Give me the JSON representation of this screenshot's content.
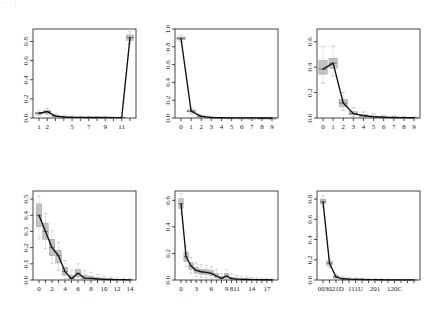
{
  "figure": {
    "artifact_text": "' ' ' |",
    "axis_label_frequency": "Fequency"
  },
  "chart_data": [
    {
      "type": "line",
      "title": "Geodesic distances",
      "xlabel": "Geodesic distances",
      "ylabel": "Fequency",
      "x_ticks": [
        "1",
        "2",
        "5",
        "7",
        "9",
        "11"
      ],
      "x_tick_positions": [
        1,
        2,
        5,
        7,
        9,
        11
      ],
      "categories": [
        "1",
        "2",
        "3",
        "4",
        "5",
        "6",
        "7",
        "8",
        "9",
        "10",
        "11",
        "Inf"
      ],
      "values": [
        0.05,
        0.066,
        0.02,
        0.01,
        0.007,
        0.006,
        0.005,
        0.005,
        0.005,
        0.004,
        0.004,
        0.84
      ],
      "box_lower": [
        0.04,
        0.05,
        0.013,
        0.006,
        0.004,
        0.003,
        0.003,
        0.003,
        0.003,
        0.002,
        0.002,
        0.81
      ],
      "box_upper": [
        0.06,
        0.08,
        0.028,
        0.015,
        0.011,
        0.009,
        0.008,
        0.008,
        0.007,
        0.006,
        0.006,
        0.868
      ],
      "whisker_lower": [
        0.028,
        0.036,
        0.006,
        0.001,
        0.001,
        0.001,
        0.0,
        0.0,
        0.0,
        0.0,
        0.0,
        0.775
      ],
      "whisker_upper": [
        0.075,
        0.098,
        0.042,
        0.026,
        0.02,
        0.017,
        0.015,
        0.014,
        0.013,
        0.012,
        0.011,
        0.9
      ],
      "ylim": [
        0.0,
        0.93
      ],
      "y_ticks": [
        "0.0",
        "0.2",
        "0.4",
        "0.6",
        "0.8"
      ],
      "y_tick_values": [
        0.0,
        0.2,
        0.4,
        0.6,
        0.8
      ],
      "grid": false,
      "legend": "none"
    },
    {
      "type": "line",
      "title": "Dyad-wise shared partners",
      "xlabel": "Dyad-wise shared partners",
      "ylabel": "Fequency",
      "x_ticks": [
        "0",
        "1",
        "2",
        "3",
        "4",
        "5",
        "6",
        "7",
        "8",
        "9"
      ],
      "categories": [
        "0",
        "1",
        "2",
        "3",
        "4",
        "5",
        "6",
        "7",
        "8",
        "9"
      ],
      "values": [
        0.895,
        0.078,
        0.018,
        0.006,
        0.003,
        0.002,
        0.001,
        0.001,
        0.0,
        0.0
      ],
      "box_lower": [
        0.88,
        0.068,
        0.013,
        0.004,
        0.002,
        0.001,
        0.0,
        0.0,
        0.0,
        0.0
      ],
      "box_upper": [
        0.91,
        0.09,
        0.024,
        0.009,
        0.005,
        0.003,
        0.002,
        0.001,
        0.001,
        0.0
      ],
      "whisker_lower": [
        0.86,
        0.052,
        0.006,
        0.001,
        0.0,
        0.0,
        0.0,
        0.0,
        0.0,
        0.0
      ],
      "whisker_upper": [
        0.932,
        0.108,
        0.034,
        0.016,
        0.009,
        0.006,
        0.004,
        0.003,
        0.002,
        0.001
      ],
      "ylim": [
        0.0,
        1.0
      ],
      "y_ticks": [
        "0.0",
        "0.2",
        "0.4",
        "0.6",
        "0.8",
        "1.0"
      ],
      "y_tick_values": [
        0.0,
        0.2,
        0.4,
        0.6,
        0.8,
        1.0
      ],
      "grid": false,
      "legend": "none"
    },
    {
      "type": "line",
      "title": "Edge-wise shared partners",
      "xlabel": "Edge-wise shared partners",
      "ylabel": "Fequency",
      "x_ticks": [
        "0",
        "1",
        "2",
        "3",
        "4",
        "5",
        "6",
        "7",
        "8",
        "9"
      ],
      "categories": [
        "0",
        "1",
        "2",
        "3",
        "4",
        "5",
        "6",
        "7",
        "8",
        "9"
      ],
      "values": [
        0.385,
        0.432,
        0.118,
        0.035,
        0.018,
        0.01,
        0.006,
        0.004,
        0.003,
        0.002
      ],
      "box_lower": [
        0.345,
        0.392,
        0.092,
        0.024,
        0.011,
        0.005,
        0.002,
        0.001,
        0.001,
        0.0
      ],
      "box_upper": [
        0.452,
        0.47,
        0.146,
        0.05,
        0.027,
        0.016,
        0.01,
        0.007,
        0.005,
        0.004
      ],
      "whisker_lower": [
        0.275,
        0.33,
        0.06,
        0.01,
        0.003,
        0.0,
        0.0,
        0.0,
        0.0,
        0.0
      ],
      "whisker_upper": [
        0.56,
        0.565,
        0.2,
        0.082,
        0.048,
        0.032,
        0.022,
        0.016,
        0.012,
        0.009
      ],
      "ylim": [
        0.0,
        0.7
      ],
      "y_ticks": [
        "0.0",
        "0.2",
        "0.4",
        "0.6"
      ],
      "y_tick_values": [
        0.0,
        0.2,
        0.4,
        0.6
      ],
      "grid": false,
      "legend": "none"
    },
    {
      "type": "line",
      "title": "Indegree",
      "xlabel": "Indegree",
      "ylabel": "Fequency",
      "x_ticks": [
        "0",
        "2",
        "4",
        "6",
        "8",
        "10",
        "12",
        "14"
      ],
      "x_tick_positions": [
        0,
        2,
        4,
        6,
        8,
        10,
        12,
        14
      ],
      "categories": [
        "0",
        "1",
        "2",
        "3",
        "4",
        "5",
        "6",
        "7",
        "8",
        "9",
        "10",
        "11",
        "12",
        "13",
        "14"
      ],
      "values": [
        0.4,
        0.3,
        0.2,
        0.15,
        0.052,
        0.008,
        0.042,
        0.012,
        0.01,
        0.006,
        0.004,
        0.003,
        0.002,
        0.002,
        0.001
      ],
      "box_lower": [
        0.33,
        0.252,
        0.15,
        0.105,
        0.03,
        0.0,
        0.02,
        0.004,
        0.003,
        0.001,
        0.0,
        0.0,
        0.0,
        0.0,
        0.0
      ],
      "box_upper": [
        0.47,
        0.352,
        0.252,
        0.185,
        0.078,
        0.028,
        0.066,
        0.028,
        0.024,
        0.015,
        0.01,
        0.007,
        0.005,
        0.004,
        0.003
      ],
      "whisker_lower": [
        0.255,
        0.195,
        0.1,
        0.062,
        0.008,
        0.0,
        0.0,
        0.0,
        0.0,
        0.0,
        0.0,
        0.0,
        0.0,
        0.0,
        0.0
      ],
      "whisker_upper": [
        0.52,
        0.41,
        0.305,
        0.232,
        0.12,
        0.06,
        0.1,
        0.058,
        0.048,
        0.034,
        0.024,
        0.018,
        0.013,
        0.01,
        0.008
      ],
      "ylim": [
        0.0,
        0.55
      ],
      "y_ticks": [
        "0.0",
        "0.1",
        "0.2",
        "0.3",
        "0.4",
        "0.5"
      ],
      "y_tick_values": [
        0.0,
        0.1,
        0.2,
        0.3,
        0.4,
        0.5
      ],
      "grid": false,
      "legend": "none"
    },
    {
      "type": "line",
      "title": "Outdegree",
      "xlabel": "Outdegree",
      "ylabel": "Fequency",
      "x_ticks": [
        "0",
        "3",
        "6",
        "9",
        "8",
        "11",
        "14",
        "17"
      ],
      "x_tick_positions": [
        0,
        3,
        6,
        9,
        10,
        11,
        14,
        17
      ],
      "categories": [
        "0",
        "1",
        "2",
        "3",
        "4",
        "5",
        "6",
        "7",
        "8",
        "9",
        "10",
        "11",
        "12",
        "13",
        "14",
        "15",
        "16",
        "17",
        "18"
      ],
      "values": [
        0.575,
        0.175,
        0.105,
        0.072,
        0.062,
        0.058,
        0.05,
        0.03,
        0.012,
        0.03,
        0.01,
        0.006,
        0.005,
        0.004,
        0.003,
        0.003,
        0.002,
        0.002,
        0.001
      ],
      "box_lower": [
        0.54,
        0.14,
        0.08,
        0.052,
        0.044,
        0.04,
        0.032,
        0.016,
        0.004,
        0.014,
        0.002,
        0.0,
        0.0,
        0.0,
        0.0,
        0.0,
        0.0,
        0.0,
        0.0
      ],
      "box_upper": [
        0.612,
        0.21,
        0.132,
        0.095,
        0.082,
        0.078,
        0.07,
        0.048,
        0.026,
        0.05,
        0.022,
        0.016,
        0.012,
        0.01,
        0.008,
        0.007,
        0.006,
        0.005,
        0.004
      ],
      "whisker_lower": [
        0.5,
        0.1,
        0.05,
        0.028,
        0.022,
        0.018,
        0.012,
        0.002,
        0.0,
        0.0,
        0.0,
        0.0,
        0.0,
        0.0,
        0.0,
        0.0,
        0.0,
        0.0,
        0.0
      ],
      "whisker_upper": [
        0.65,
        0.255,
        0.17,
        0.128,
        0.115,
        0.11,
        0.1,
        0.078,
        0.05,
        0.08,
        0.044,
        0.034,
        0.028,
        0.023,
        0.019,
        0.016,
        0.014,
        0.012,
        0.01
      ],
      "ylim": [
        0.0,
        0.67
      ],
      "y_ticks": [
        "0.0",
        "0.2",
        "0.4",
        "0.6"
      ],
      "y_tick_values": [
        0.0,
        0.2,
        0.4,
        0.6
      ],
      "grid": false,
      "legend": "none"
    },
    {
      "type": "line",
      "title": "Triad census",
      "xlabel": "Triad census",
      "ylabel": "Fequency",
      "x_ticks": [
        "003",
        "021D",
        "111U",
        "201",
        "120C"
      ],
      "x_tick_positions": [
        0,
        2,
        5,
        8,
        11
      ],
      "categories": [
        "003",
        "012",
        "021D",
        "021U",
        "021C",
        "111D",
        "111U",
        "030T",
        "030C",
        "201",
        "120D",
        "120U",
        "120C",
        "210",
        "300"
      ],
      "values": [
        0.775,
        0.165,
        0.03,
        0.012,
        0.008,
        0.006,
        0.005,
        0.004,
        0.003,
        0.003,
        0.002,
        0.002,
        0.002,
        0.001,
        0.001
      ],
      "box_lower": [
        0.752,
        0.145,
        0.02,
        0.006,
        0.003,
        0.002,
        0.001,
        0.001,
        0.0,
        0.0,
        0.0,
        0.0,
        0.0,
        0.0,
        0.0
      ],
      "box_upper": [
        0.8,
        0.188,
        0.042,
        0.02,
        0.014,
        0.011,
        0.009,
        0.008,
        0.006,
        0.006,
        0.005,
        0.004,
        0.004,
        0.003,
        0.003
      ],
      "whisker_lower": [
        0.726,
        0.122,
        0.01,
        0.0,
        0.0,
        0.0,
        0.0,
        0.0,
        0.0,
        0.0,
        0.0,
        0.0,
        0.0,
        0.0,
        0.0
      ],
      "whisker_upper": [
        0.832,
        0.215,
        0.058,
        0.034,
        0.025,
        0.02,
        0.017,
        0.015,
        0.012,
        0.012,
        0.01,
        0.009,
        0.008,
        0.007,
        0.006
      ],
      "ylim": [
        0.0,
        0.88
      ],
      "y_ticks": [
        "0.0",
        "0.2",
        "0.4",
        "0.6",
        "0.8"
      ],
      "y_tick_values": [
        0.0,
        0.2,
        0.4,
        0.6,
        0.8
      ],
      "grid": false,
      "legend": "none"
    }
  ]
}
